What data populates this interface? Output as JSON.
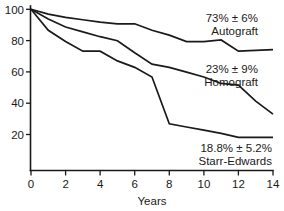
{
  "chart_data": {
    "type": "line",
    "title": "",
    "subtitle": "",
    "xlabel": "Years",
    "ylabel": "",
    "xlim": [
      0,
      14
    ],
    "ylim": [
      0,
      100
    ],
    "xticks": [
      0,
      2,
      4,
      6,
      8,
      10,
      12,
      14
    ],
    "xtick_labels": [
      "0",
      "2",
      "4",
      "6",
      "8",
      "10",
      "12",
      "14"
    ],
    "yticks": [
      20,
      40,
      60,
      80,
      100
    ],
    "ytick_labels": [
      "20",
      "40",
      "60",
      "80",
      "100"
    ],
    "grid": false,
    "legend_position": "inline-annotations",
    "series": [
      {
        "name": "Autograft",
        "annotation_value": "73% ± 6%",
        "annotation_label": "Autograft",
        "x": [
          0,
          1,
          2,
          3,
          4,
          5,
          6,
          7,
          8,
          9,
          10,
          11,
          12,
          13,
          14
        ],
        "y": [
          100,
          97,
          95,
          93.5,
          92,
          91,
          91,
          87,
          84,
          80,
          80,
          81,
          74,
          74.5,
          75
        ]
      },
      {
        "name": "Homograft",
        "annotation_value": "23% ± 9%",
        "annotation_label": "Homograft",
        "x": [
          0,
          1,
          2,
          3,
          4,
          5,
          6,
          7,
          8,
          9,
          10,
          11,
          12,
          13,
          14
        ],
        "y": [
          100,
          94,
          89,
          86,
          83,
          80.5,
          73,
          66,
          64,
          61,
          58,
          54,
          53,
          43,
          35
        ]
      },
      {
        "name": "Starr-Edwards",
        "annotation_value": "18.8% ± 5.2%",
        "annotation_label": "Starr-Edwards",
        "x": [
          0,
          1,
          2,
          3,
          4,
          5,
          6,
          7,
          8,
          9,
          10,
          11,
          12,
          13,
          14
        ],
        "y": [
          100,
          87,
          80,
          74,
          74,
          68,
          64,
          58,
          29,
          27,
          25,
          23,
          20.5,
          20.5,
          20.5
        ]
      }
    ]
  },
  "annotations": {
    "autograft": {
      "value": "73% ± 6%",
      "label": "Autograft"
    },
    "homograft": {
      "value": "23% ± 9%",
      "label": "Homograft"
    },
    "starr_edwards": {
      "value": "18.8% ± 5.2%",
      "label": "Starr-Edwards"
    }
  },
  "axes": {
    "x_title": "Years",
    "x_tick_0": "0",
    "x_tick_2": "2",
    "x_tick_4": "4",
    "x_tick_6": "6",
    "x_tick_8": "8",
    "x_tick_10": "10",
    "x_tick_12": "12",
    "x_tick_14": "14",
    "y_tick_20": "20",
    "y_tick_40": "40",
    "y_tick_60": "60",
    "y_tick_80": "80",
    "y_tick_100": "100"
  },
  "colors": {
    "line": "#1a1a1a",
    "background": "#ffffff",
    "axis": "#1a1a1a"
  }
}
